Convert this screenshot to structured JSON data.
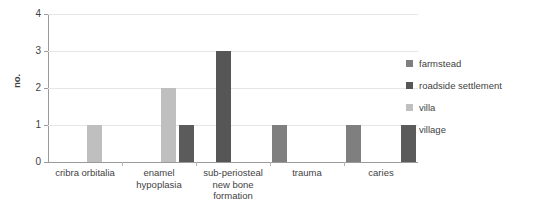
{
  "chart_data": {
    "type": "bar",
    "title": "",
    "xlabel": "",
    "ylabel": "no.",
    "ylim": [
      0,
      4
    ],
    "yticks": [
      0,
      1,
      2,
      3,
      4
    ],
    "grid": true,
    "legend_position": "right",
    "categories": [
      "cribra orbitalia",
      "enamel\nhypoplasia",
      "sub-periosteal\nnew bone\nformation",
      "trauma",
      "caries"
    ],
    "series": [
      {
        "name": "farmstead",
        "color": "#7f7f7f",
        "values": [
          0,
          0,
          0,
          1,
          1
        ]
      },
      {
        "name": "roadside settlement",
        "color": "#565656",
        "values": [
          0,
          0,
          3,
          0,
          0
        ]
      },
      {
        "name": "villa",
        "color": "#bfbfbf",
        "values": [
          1,
          2,
          0,
          0,
          0
        ]
      },
      {
        "name": "village",
        "color": "#5b5b5b",
        "values": [
          0,
          1,
          0,
          0,
          1
        ]
      }
    ]
  },
  "axis": {
    "y_tick_0": "0",
    "y_tick_1": "1",
    "y_tick_2": "2",
    "y_tick_3": "3",
    "y_tick_4": "4",
    "y_title": "no."
  },
  "legend": {
    "items": [
      {
        "label": "farmstead"
      },
      {
        "label": "roadside settlement"
      },
      {
        "label": "villa"
      },
      {
        "label": "village"
      }
    ]
  }
}
